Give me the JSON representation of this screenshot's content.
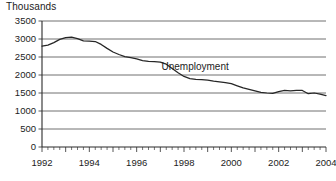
{
  "chart_data": {
    "type": "line",
    "title": "",
    "axis_unit_label": "Thousands",
    "xlabel": "",
    "ylabel": "Thousands",
    "ylim": [
      0,
      3500
    ],
    "xlim": [
      1992,
      2004
    ],
    "yticks": [
      0,
      500,
      1000,
      1500,
      2000,
      2500,
      3000,
      3500
    ],
    "ytick_labels": [
      "0",
      "500",
      "1000",
      "1500",
      "2000",
      "2500",
      "3000",
      "3500"
    ],
    "xticks": [
      1992,
      1994,
      1996,
      1998,
      2000,
      2002,
      2004
    ],
    "xtick_labels": [
      "1992",
      "1994",
      "1996",
      "1998",
      "2000",
      "2002",
      "2004"
    ],
    "x_minor_tick_interval": 0.25,
    "grid": "horizontal",
    "legend": "none",
    "annotations": [
      {
        "text": "Unemployment",
        "x": 1997.05,
        "y": 2150
      }
    ],
    "series": [
      {
        "name": "Unemployment",
        "color": "#262626",
        "x": [
          1992.0,
          1992.25,
          1992.5,
          1992.75,
          1993.0,
          1993.25,
          1993.5,
          1993.75,
          1994.0,
          1994.25,
          1994.5,
          1994.75,
          1995.0,
          1995.25,
          1995.5,
          1995.75,
          1996.0,
          1996.25,
          1996.5,
          1996.75,
          1997.0,
          1997.25,
          1997.5,
          1997.75,
          1998.0,
          1998.25,
          1998.5,
          1998.75,
          1999.0,
          1999.25,
          1999.5,
          1999.75,
          2000.0,
          2000.25,
          2000.5,
          2000.75,
          2001.0,
          2001.25,
          2001.5,
          2001.75,
          2002.0,
          2002.25,
          2002.5,
          2002.75,
          2003.0,
          2003.25,
          2003.5,
          2003.75,
          2004.0
        ],
        "values": [
          2800,
          2830,
          2900,
          2990,
          3040,
          3050,
          3010,
          2950,
          2940,
          2930,
          2850,
          2740,
          2640,
          2570,
          2510,
          2480,
          2450,
          2400,
          2380,
          2370,
          2360,
          2300,
          2180,
          2060,
          1960,
          1900,
          1880,
          1870,
          1860,
          1830,
          1810,
          1790,
          1760,
          1700,
          1640,
          1600,
          1560,
          1520,
          1500,
          1490,
          1540,
          1570,
          1560,
          1570,
          1570,
          1480,
          1500,
          1470,
          1430
        ]
      }
    ]
  }
}
